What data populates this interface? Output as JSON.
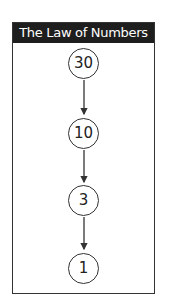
{
  "title": "The Law of Numbers",
  "nodes": [
    {
      "label": "30"
    },
    {
      "label": "10"
    },
    {
      "label": "3"
    },
    {
      "label": "1"
    }
  ],
  "edges": [
    {
      "from": "30",
      "to": "10"
    },
    {
      "from": "10",
      "to": "3"
    },
    {
      "from": "3",
      "to": "1"
    }
  ],
  "colors": {
    "header_bg": "#1e1e1e",
    "header_text": "#ffffff",
    "stroke": "#333333"
  }
}
